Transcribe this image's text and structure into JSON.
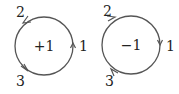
{
  "diagrams": [
    {
      "center_label": "+1",
      "orientation": "counterclockwise",
      "points": [
        {
          "label": "1",
          "position": "right"
        },
        {
          "label": "2",
          "position": "upper-left"
        },
        {
          "label": "3",
          "position": "lower-left"
        }
      ]
    },
    {
      "center_label": "−1",
      "orientation": "clockwise",
      "points": [
        {
          "label": "1",
          "position": "right"
        },
        {
          "label": "2",
          "position": "upper-left"
        },
        {
          "label": "3",
          "position": "lower-left"
        }
      ]
    }
  ],
  "colors": {
    "stroke": "#555555",
    "text": "#222222"
  }
}
